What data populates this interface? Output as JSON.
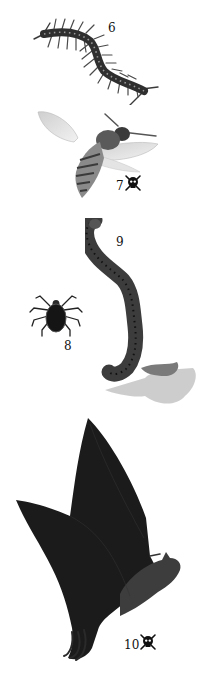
{
  "plate": {
    "specimens": [
      {
        "id": "centipede",
        "number": "6",
        "poisonous": false
      },
      {
        "id": "wasp",
        "number": "7",
        "poisonous": true
      },
      {
        "id": "tick",
        "number": "8",
        "poisonous": false
      },
      {
        "id": "leech",
        "number": "9",
        "poisonous": false
      },
      {
        "id": "bat",
        "number": "10",
        "poisonous": true
      }
    ]
  },
  "colors": {
    "background": "#ffffff",
    "ink": "#111111",
    "centipede": "#3a3a3a",
    "wasp_wing": "#d8d8d8",
    "wasp_body": "#6a6a6a",
    "tick": "#151515",
    "leech": "#4a4a4a",
    "bat": "#1a1a1a",
    "shadow": "#bdbdbd"
  }
}
